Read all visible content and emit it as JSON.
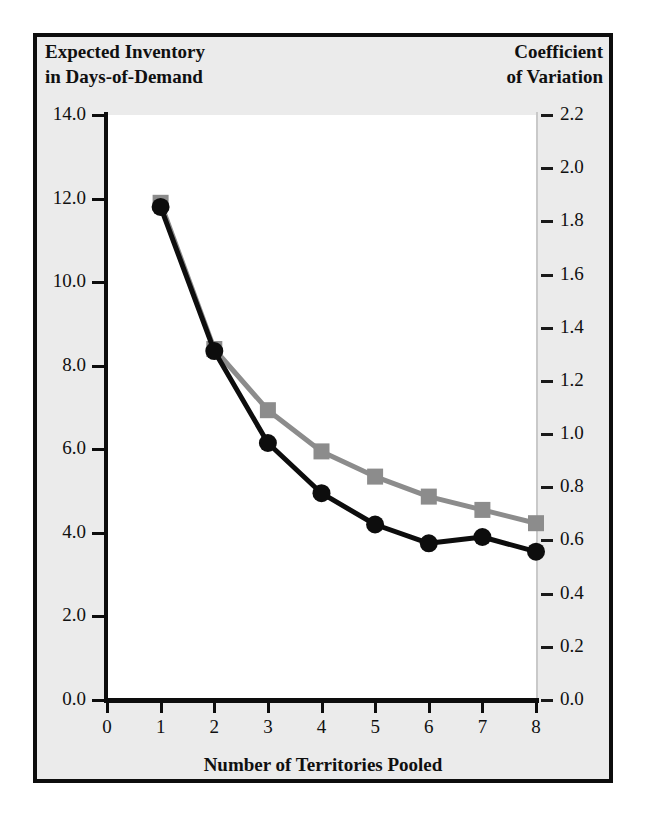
{
  "figure": {
    "background_color": "#ffffff",
    "panel_background_color": "#ebebeb",
    "plot_background_color": "#ffffff",
    "border_color": "#0d0d0d"
  },
  "titles": {
    "left_axis": "Expected Inventory\nin Days-of-Demand",
    "right_axis": "Coefficient\nof Variation",
    "x_axis": "Number of Territories Pooled"
  },
  "chart_data": {
    "type": "line",
    "title": "",
    "subtitle": "",
    "xlabel": "Number of Territories Pooled",
    "ylabel": "Expected Inventory in Days-of-Demand",
    "y2label": "Coefficient of Variation",
    "x": [
      1,
      2,
      3,
      4,
      5,
      6,
      7,
      8
    ],
    "xlim": [
      0,
      8
    ],
    "ylim": [
      0.0,
      14.0
    ],
    "y2lim": [
      0.0,
      2.2
    ],
    "xticks": [
      "0",
      "1",
      "2",
      "3",
      "4",
      "5",
      "6",
      "7",
      "8"
    ],
    "yticks": [
      "0.0",
      "2.0",
      "4.0",
      "6.0",
      "8.0",
      "10.0",
      "12.0",
      "14.0"
    ],
    "y2ticks": [
      "0.0",
      "0.2",
      "0.4",
      "0.6",
      "0.8",
      "1.0",
      "1.2",
      "1.4",
      "1.6",
      "1.8",
      "2.0",
      "2.2"
    ],
    "grid": false,
    "legend": "none",
    "series": [
      {
        "name": "Expected Inventory in Days-of-Demand",
        "axis": "left",
        "color": "#0d0d0d",
        "marker": "circle",
        "values": [
          11.8,
          8.35,
          6.15,
          4.95,
          4.2,
          3.75,
          3.9,
          3.55
        ]
      },
      {
        "name": "Coefficient of Variation",
        "axis": "right",
        "color": "#8c8c8c",
        "marker": "square",
        "values": [
          1.87,
          1.32,
          1.09,
          0.935,
          0.84,
          0.765,
          0.715,
          0.665
        ]
      }
    ]
  }
}
